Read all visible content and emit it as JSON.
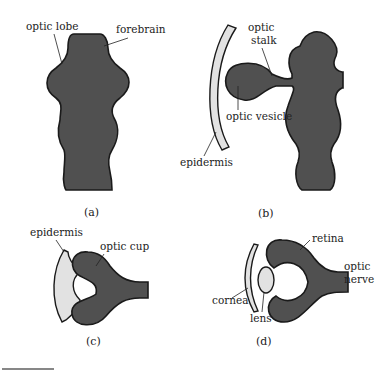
{
  "figure": {
    "colors": {
      "neural_tissue": "#505050",
      "outline": "#1a1a1a",
      "epidermis_fill": "#e2e2e2",
      "background": "#ffffff"
    },
    "panels": [
      {
        "id": "a",
        "caption": "(a)",
        "labels": {
          "optic_lobe": "optic lobe",
          "forebrain": "forebrain"
        }
      },
      {
        "id": "b",
        "caption": "(b)",
        "labels": {
          "optic_stalk_1": "optic",
          "optic_stalk_2": "stalk",
          "optic_vesicle": "optic vesicle",
          "epidermis": "epidermis"
        }
      },
      {
        "id": "c",
        "caption": "(c)",
        "labels": {
          "epidermis": "epidermis",
          "optic_cup": "optic cup"
        }
      },
      {
        "id": "d",
        "caption": "(d)",
        "labels": {
          "retina": "retina",
          "optic_nerve_1": "optic",
          "optic_nerve_2": "nerve",
          "cornea": "cornea",
          "lens": "lens"
        }
      }
    ]
  }
}
